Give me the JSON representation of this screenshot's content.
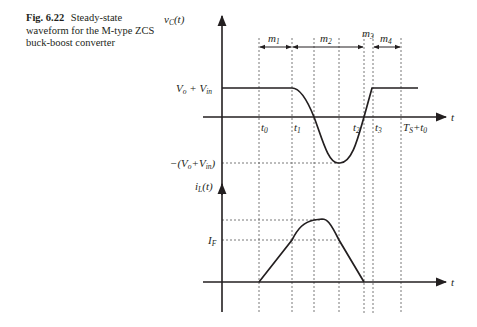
{
  "caption": {
    "figure_number": "Fig. 6.22",
    "text": "Steady-state waveform for the M-type ZCS buck-boost converter"
  },
  "diagram": {
    "top_plot": {
      "y_axis_label": "v_C(t)",
      "x_axis_label": "t",
      "level_high": "V_o + V_in",
      "level_low": "−(V_o+V_in)"
    },
    "bottom_plot": {
      "y_axis_label": "i_L(t)",
      "x_axis_label": "t",
      "level_mid": "I_F"
    },
    "time_markers": [
      "t_0",
      "t_1",
      "t_2",
      "t_3",
      "T_S + t_0"
    ],
    "intervals": [
      "m_1",
      "m_2",
      "m_3",
      "m_4"
    ]
  }
}
